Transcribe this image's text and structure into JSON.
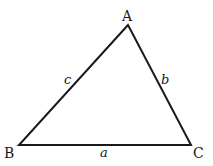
{
  "diagram": {
    "type": "triangle",
    "vertices": [
      {
        "id": "A",
        "label": "A",
        "x": 128,
        "y": 25
      },
      {
        "id": "B",
        "label": "B",
        "x": 19,
        "y": 145
      },
      {
        "id": "C",
        "label": "C",
        "x": 191,
        "y": 145
      }
    ],
    "sides": [
      {
        "id": "a",
        "label": "a",
        "from": "B",
        "to": "C"
      },
      {
        "id": "b",
        "label": "b",
        "from": "A",
        "to": "C"
      },
      {
        "id": "c",
        "label": "c",
        "from": "A",
        "to": "B"
      }
    ],
    "stroke_color": "#1a1a1a"
  }
}
